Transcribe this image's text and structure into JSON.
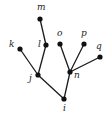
{
  "diagram": {
    "type": "tree",
    "root": "i",
    "nodes": [
      {
        "id": "i",
        "label": "i",
        "x": 64,
        "y": 99,
        "lx": 63,
        "ly": 111
      },
      {
        "id": "j",
        "label": "j",
        "x": 38,
        "y": 75,
        "lx": 29,
        "ly": 81
      },
      {
        "id": "n",
        "label": "n",
        "x": 70,
        "y": 72,
        "lx": 74,
        "ly": 78
      },
      {
        "id": "k",
        "label": "k",
        "x": 20,
        "y": 49,
        "lx": 9,
        "ly": 47
      },
      {
        "id": "l",
        "label": "l",
        "x": 46,
        "y": 45,
        "lx": 38,
        "ly": 47
      },
      {
        "id": "m",
        "label": "m",
        "x": 40,
        "y": 19,
        "lx": 37,
        "ly": 10
      },
      {
        "id": "o",
        "label": "o",
        "x": 60,
        "y": 44,
        "lx": 57,
        "ly": 36
      },
      {
        "id": "p",
        "label": "p",
        "x": 84,
        "y": 44,
        "lx": 81,
        "ly": 36
      },
      {
        "id": "q",
        "label": "q",
        "x": 100,
        "y": 57,
        "lx": 96,
        "ly": 49
      }
    ],
    "edges": [
      [
        "i",
        "j"
      ],
      [
        "i",
        "n"
      ],
      [
        "j",
        "k"
      ],
      [
        "j",
        "l"
      ],
      [
        "l",
        "m"
      ],
      [
        "n",
        "o"
      ],
      [
        "n",
        "p"
      ],
      [
        "n",
        "q"
      ]
    ]
  }
}
